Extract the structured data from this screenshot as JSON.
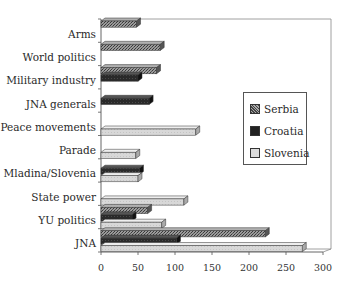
{
  "chart_data": {
    "type": "bar",
    "orientation": "horizontal",
    "style": "3d-clustered",
    "title": "",
    "xlabel": "",
    "ylabel": "",
    "xlim": [
      0,
      300
    ],
    "x_ticks": [
      0,
      50,
      100,
      150,
      200,
      250,
      300
    ],
    "grid": false,
    "legend_position": "right-inside",
    "categories": [
      "Arms",
      "World politics",
      "Military industry",
      "JNA generals",
      "Peace movements",
      "Parade",
      "Mladina/Slovenia",
      "State power",
      "YU politics",
      "JNA"
    ],
    "series": [
      {
        "name": "Serbia",
        "color": "#7a7a7a",
        "pattern": "crosshatch",
        "values": [
          48,
          80,
          75,
          0,
          0,
          0,
          0,
          0,
          63,
          222
        ]
      },
      {
        "name": "Croatia",
        "color": "#2e2e2e",
        "pattern": "dark",
        "values": [
          0,
          0,
          50,
          65,
          0,
          0,
          52,
          0,
          42,
          102
        ]
      },
      {
        "name": "Slovenia",
        "color": "#d4d4d4",
        "pattern": "light",
        "values": [
          0,
          0,
          0,
          0,
          128,
          47,
          50,
          112,
          82,
          272
        ]
      }
    ]
  }
}
